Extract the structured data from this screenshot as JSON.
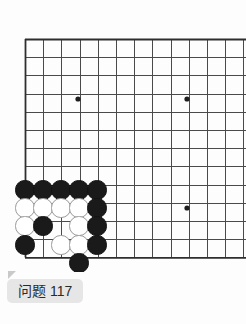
{
  "board": {
    "name": "go-board",
    "background_color": "#fdfdfd",
    "line_color": "#4a4a4a",
    "line_width": 1,
    "spacing": 18.2,
    "origin_x": 25,
    "origin_y": 39,
    "visible_cols": 12,
    "visible_rows": 13,
    "edges": {
      "left": true,
      "top": true,
      "bottom": true,
      "right": false
    },
    "star_points": [
      {
        "col": 3,
        "row": 3,
        "x": 78,
        "y": 99
      },
      {
        "col": 9,
        "row": 3,
        "x": 187,
        "y": 99
      },
      {
        "col": 9,
        "row": 9,
        "x": 187,
        "y": 208
      }
    ],
    "star_point_radius": 2.6,
    "stone_radius": 9.6,
    "black_color": "#1a1a1a",
    "white_color": "#ffffff",
    "white_outline_color": "#9a9a9a",
    "stones": [
      {
        "color": "black",
        "col": 0,
        "row": 8,
        "x": 25,
        "y": 190
      },
      {
        "color": "black",
        "col": 1,
        "row": 8,
        "x": 43,
        "y": 190
      },
      {
        "color": "black",
        "col": 2,
        "row": 8,
        "x": 61,
        "y": 190
      },
      {
        "color": "black",
        "col": 3,
        "row": 8,
        "x": 79,
        "y": 190
      },
      {
        "color": "black",
        "col": 4,
        "row": 8,
        "x": 97,
        "y": 190
      },
      {
        "color": "white",
        "col": 0,
        "row": 9,
        "x": 25,
        "y": 208
      },
      {
        "color": "white",
        "col": 1,
        "row": 9,
        "x": 43,
        "y": 208
      },
      {
        "color": "white",
        "col": 2,
        "row": 9,
        "x": 61,
        "y": 208
      },
      {
        "color": "white",
        "col": 3,
        "row": 9,
        "x": 79,
        "y": 208
      },
      {
        "color": "black",
        "col": 4,
        "row": 9,
        "x": 97,
        "y": 208
      },
      {
        "color": "white",
        "col": 0,
        "row": 10,
        "x": 25,
        "y": 226
      },
      {
        "color": "black",
        "col": 1,
        "row": 10,
        "x": 43,
        "y": 226
      },
      {
        "color": "white",
        "col": 3,
        "row": 10,
        "x": 79,
        "y": 226
      },
      {
        "color": "black",
        "col": 4,
        "row": 10,
        "x": 97,
        "y": 226
      },
      {
        "color": "black",
        "col": 0,
        "row": 11,
        "x": 25,
        "y": 245
      },
      {
        "color": "white",
        "col": 2,
        "row": 11,
        "x": 61,
        "y": 245
      },
      {
        "color": "white",
        "col": 3,
        "row": 11,
        "x": 79,
        "y": 245
      },
      {
        "color": "black",
        "col": 4,
        "row": 11,
        "x": 97,
        "y": 245
      },
      {
        "color": "black",
        "col": 3,
        "row": 12,
        "x": 79,
        "y": 263
      }
    ]
  },
  "label": {
    "text": "问题 117",
    "title": "问题",
    "number": "117",
    "background_color": "#e6e6e6",
    "text_color": "#2a2a2a",
    "pointer_color": "#c9c9c9"
  }
}
